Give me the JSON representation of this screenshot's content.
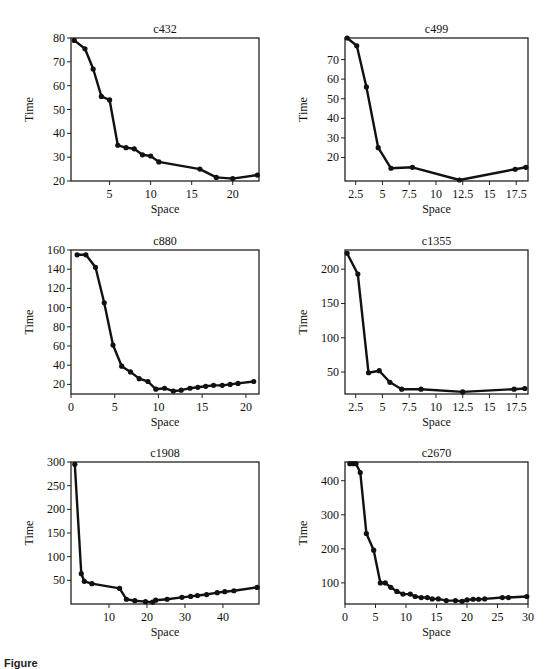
{
  "figure": {
    "caption_prefix": "Figure",
    "caption_rest": "10.10  Time versus space (cut off)"
  },
  "chart_data": [
    {
      "id": "c432",
      "type": "line",
      "title": "c432",
      "xlabel": "Space",
      "ylabel": "Time",
      "xlim": [
        0.3,
        23.2
      ],
      "ylim": [
        20,
        80
      ],
      "xticks": [
        5,
        10,
        15,
        20
      ],
      "xtick_labels": [
        "5",
        "10",
        "15",
        "20"
      ],
      "yticks": [
        20,
        30,
        40,
        50,
        60,
        70,
        80
      ],
      "ytick_labels": [
        "20",
        "30",
        "40",
        "50",
        "60",
        "70",
        "80"
      ],
      "grid": false,
      "x": [
        0.7,
        2,
        3,
        4,
        5,
        6,
        7,
        8,
        9,
        10,
        11,
        16,
        18,
        20,
        23
      ],
      "y": [
        79,
        75.5,
        67,
        55.5,
        54,
        35,
        34,
        33.5,
        31,
        30.5,
        28,
        25,
        21.5,
        21,
        22.5
      ]
    },
    {
      "id": "c499",
      "type": "line",
      "title": "c499",
      "xlabel": "Space",
      "ylabel": "Time",
      "xlim": [
        1.5,
        18.6
      ],
      "ylim": [
        8,
        81
      ],
      "xticks": [
        2.5,
        5,
        7.5,
        10,
        12.5,
        15,
        17.5
      ],
      "xtick_labels": [
        "2.5",
        "5",
        "7.5",
        "10",
        "12.5",
        "15",
        "17.5"
      ],
      "yticks": [
        20,
        30,
        40,
        50,
        60,
        70
      ],
      "ytick_labels": [
        "20",
        "30",
        "40",
        "50",
        "60",
        "70"
      ],
      "grid": false,
      "x": [
        1.7,
        2.6,
        3.5,
        4.6,
        5.8,
        7.8,
        12.2,
        17.4,
        18.4
      ],
      "y": [
        81,
        77,
        56,
        25,
        14.5,
        15,
        8.5,
        14,
        15
      ]
    },
    {
      "id": "c880",
      "type": "line",
      "title": "c880",
      "xlabel": "Space",
      "ylabel": "Time",
      "xlim": [
        0,
        21.5
      ],
      "ylim": [
        10,
        160
      ],
      "xticks": [
        0,
        5,
        10,
        15,
        20
      ],
      "xtick_labels": [
        "0",
        "5",
        "10",
        "15",
        "20"
      ],
      "yticks": [
        20,
        40,
        60,
        80,
        100,
        120,
        140,
        160
      ],
      "ytick_labels": [
        "20",
        "40",
        "60",
        "80",
        "100",
        "120",
        "140",
        "160"
      ],
      "grid": false,
      "x": [
        0.7,
        1.7,
        2.8,
        3.8,
        4.8,
        5.8,
        6.8,
        7.8,
        8.8,
        9.7,
        10.7,
        11.7,
        12.6,
        13.6,
        14.5,
        15.4,
        16.3,
        17.3,
        18.2,
        19.1,
        20.9
      ],
      "y": [
        155,
        155,
        142,
        105,
        61,
        39,
        33,
        26,
        23,
        15,
        16,
        13,
        14,
        16,
        17,
        18,
        19,
        19,
        20,
        21,
        23
      ]
    },
    {
      "id": "c1355",
      "type": "line",
      "title": "c1355",
      "xlabel": "Space",
      "ylabel": "Time",
      "xlim": [
        1.5,
        18.6
      ],
      "ylim": [
        18,
        228
      ],
      "xticks": [
        2.5,
        5,
        7.5,
        10,
        12.5,
        15,
        17.5
      ],
      "xtick_labels": [
        "2.5",
        "5",
        "7.5",
        "10",
        "12.5",
        "15",
        "17.5"
      ],
      "yticks": [
        50,
        100,
        150,
        200
      ],
      "ytick_labels": [
        "50",
        "100",
        "150",
        "200"
      ],
      "grid": false,
      "x": [
        1.7,
        2.7,
        3.7,
        4.7,
        5.7,
        6.8,
        8.6,
        12.5,
        17.3,
        18.3
      ],
      "y": [
        223,
        193,
        49,
        52,
        35,
        25,
        25,
        21,
        25,
        26
      ]
    },
    {
      "id": "c1908",
      "type": "line",
      "title": "c1908",
      "xlabel": "Space",
      "ylabel": "Time",
      "xlim": [
        0,
        49.5
      ],
      "ylim": [
        0,
        300
      ],
      "xticks": [
        10,
        20,
        30,
        40
      ],
      "xtick_labels": [
        "10",
        "20",
        "30",
        "40"
      ],
      "yticks": [
        50,
        100,
        150,
        200,
        250,
        300
      ],
      "ytick_labels": [
        "50",
        "100",
        "150",
        "200",
        "250",
        "300"
      ],
      "grid": false,
      "x": [
        1,
        2.7,
        3.5,
        5.5,
        12.8,
        14.6,
        16.8,
        19.6,
        21.5,
        22.3,
        25.3,
        29.2,
        31.5,
        33.3,
        35.7,
        38.5,
        40.5,
        42.9,
        49
      ],
      "y": [
        295,
        64,
        48,
        43,
        33,
        10,
        7,
        5,
        4,
        8,
        10,
        14,
        16,
        18,
        20,
        24,
        26,
        28,
        35
      ]
    },
    {
      "id": "c2670",
      "type": "line",
      "title": "c2670",
      "xlabel": "Space",
      "ylabel": "Time",
      "xlim": [
        0,
        30
      ],
      "ylim": [
        38,
        455
      ],
      "xticks": [
        0,
        5,
        10,
        15,
        20,
        25,
        30
      ],
      "xtick_labels": [
        "0",
        "5",
        "10",
        "15",
        "20",
        "25",
        "30"
      ],
      "yticks": [
        100,
        200,
        300,
        400
      ],
      "ytick_labels": [
        "100",
        "200",
        "300",
        "400"
      ],
      "grid": false,
      "x": [
        0.8,
        1.3,
        1.8,
        2.5,
        3.5,
        4.7,
        5.8,
        6.6,
        7.5,
        8.5,
        9.5,
        10.7,
        11.5,
        12.5,
        13.5,
        14.3,
        15.3,
        16.6,
        18.1,
        19.2,
        20.0,
        21.0,
        21.9,
        22.9,
        25.8,
        26.8,
        29.8
      ],
      "y": [
        450,
        450,
        450,
        424,
        245,
        196,
        100,
        100,
        87,
        75,
        67,
        67,
        60,
        57,
        57,
        53,
        53,
        48,
        48,
        46,
        50,
        52,
        52,
        53,
        57,
        57,
        60
      ]
    }
  ],
  "layout": [
    {
      "left": 71,
      "top": 38,
      "width": 188,
      "height": 143
    },
    {
      "left": 345,
      "top": 38,
      "width": 183,
      "height": 143
    },
    {
      "left": 71,
      "top": 250,
      "width": 188,
      "height": 144
    },
    {
      "left": 345,
      "top": 250,
      "width": 183,
      "height": 144
    },
    {
      "left": 71,
      "top": 462,
      "width": 188,
      "height": 142
    },
    {
      "left": 345,
      "top": 462,
      "width": 183,
      "height": 142
    }
  ],
  "style": {
    "line_color": "#111111",
    "marker_color": "#111111",
    "frame_color": "#222222"
  }
}
